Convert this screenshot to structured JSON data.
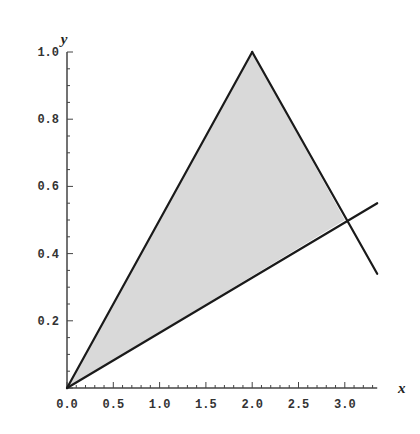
{
  "chart_data": {
    "type": "area",
    "title": "",
    "xlabel": "x",
    "ylabel": "y",
    "xlim": [
      0,
      3.35
    ],
    "ylim": [
      0,
      1.0
    ],
    "grid": false,
    "legend": null,
    "x_ticks": [
      "0.0",
      "0.5",
      "1.0",
      "1.5",
      "2.0",
      "2.5",
      "3.0"
    ],
    "y_ticks": [
      "0.2",
      "0.4",
      "0.6",
      "0.8",
      "1.0"
    ],
    "series": [
      {
        "name": "line y = x/2",
        "type": "line",
        "points": [
          [
            0,
            0
          ],
          [
            2,
            1
          ]
        ]
      },
      {
        "name": "line y = 2 - x/2",
        "type": "line",
        "points": [
          [
            2,
            1
          ],
          [
            3.35,
            0.34
          ]
        ]
      },
      {
        "name": "line y = x/6",
        "type": "line",
        "points": [
          [
            0,
            0
          ],
          [
            3.35,
            0.55
          ]
        ]
      }
    ],
    "shaded_region": {
      "fill": "#d9d9d9",
      "vertices": [
        [
          0,
          0
        ],
        [
          2,
          1
        ],
        [
          3,
          0.5
        ]
      ]
    }
  },
  "colors": {
    "line": "#1a1a1a",
    "shade": "#d9d9d9",
    "axis": "#444444"
  }
}
